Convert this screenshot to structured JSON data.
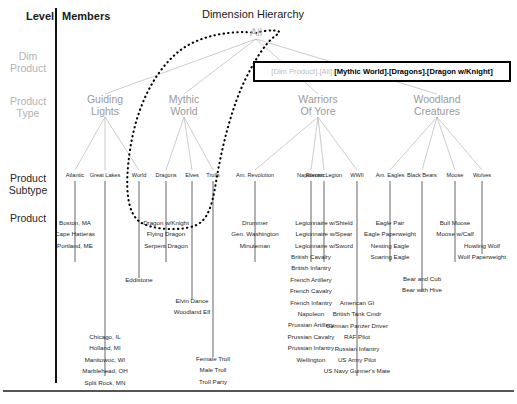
{
  "header": {
    "level_label": "Level",
    "members_label": "Members",
    "title": "Dimension Hierarchy"
  },
  "levels": [
    {
      "name": "dim-product",
      "label": "Dim\nProduct",
      "line1": "Dim",
      "line2": "Product",
      "tone": "gray",
      "y": 50
    },
    {
      "name": "product-type",
      "label": "Product\nType",
      "line1": "Product",
      "line2": "Type",
      "tone": "gray",
      "y": 95
    },
    {
      "name": "product-subtype",
      "label": "Product\nSubtype",
      "line1": "Product",
      "line2": "Subtype",
      "tone": "dark",
      "y": 172
    },
    {
      "name": "product",
      "label": "Product",
      "line1": "Product",
      "line2": "",
      "tone": "dark",
      "y": 212
    }
  ],
  "root": {
    "label": "All",
    "x": 256,
    "y": 33
  },
  "callout": {
    "prefix": "[Dim Product].[All].",
    "highlight": "[Mythic World].[Dragons].[Dragon w/Knight]"
  },
  "product_types": [
    {
      "name": "guiding-lights",
      "line1": "Guiding",
      "line2": "Lights",
      "x": 105
    },
    {
      "name": "mythic-world",
      "line1": "Mythic",
      "line2": "World",
      "x": 184
    },
    {
      "name": "warriors-of-yore",
      "line1": "Warriors",
      "line2": "Of Yore",
      "x": 318
    },
    {
      "name": "woodland-creatures",
      "line1": "Woodland",
      "line2": "Creatures",
      "x": 437
    }
  ],
  "subtypes": [
    {
      "name": "atlantic",
      "label": "Atlantic",
      "x": 75,
      "products": [
        "Boston, MA",
        "Cape Hatteras",
        "Portland, ME"
      ],
      "products_top": 217,
      "stem_bottom": 262
    },
    {
      "name": "great-lakes",
      "label": "Great Lakes",
      "x": 105,
      "products": [
        "Chicago, IL",
        "Holland, MI",
        "Manitowoc, WI",
        "Marblehead, OH",
        "Split Rock, MN"
      ],
      "products_top": 331,
      "stem_bottom": 376
    },
    {
      "name": "world",
      "label": "World",
      "x": 139,
      "products": [
        "Eddistone"
      ],
      "products_top": 274,
      "stem_bottom": 278
    },
    {
      "name": "dragons",
      "label": "Dragons",
      "x": 166,
      "products": [
        "Dragon w/Knight",
        "Flying Dragon",
        "Serpent Dragon"
      ],
      "products_top": 217,
      "stem_bottom": 262
    },
    {
      "name": "elves",
      "label": "Elves",
      "x": 192,
      "products": [
        "Elvin Dance",
        "Woodland Elf"
      ],
      "products_top": 295,
      "stem_bottom": 299
    },
    {
      "name": "trolls",
      "label": "Trolls",
      "x": 213,
      "products": [
        "Female Troll",
        "Male Troll",
        "Troll Party"
      ],
      "products_top": 353,
      "stem_bottom": 357
    },
    {
      "name": "am-revolution",
      "label": "Am. Revolution",
      "x": 255,
      "products": [
        "Drummer",
        "Gen. Washington",
        "Minuteman"
      ],
      "products_top": 217,
      "stem_bottom": 262
    },
    {
      "name": "napoleonic",
      "label": "Napoleonic",
      "x": 311,
      "products": [
        "British Cavalry",
        "British Infantry",
        "French Artillery",
        "French Cavalry",
        "French Infantry",
        "Napoleon",
        "Prussian Artillery",
        "Prussian Cavalry",
        "Prussian Infantry",
        "Wellington"
      ],
      "products_top": 251,
      "stem_bottom": 262
    },
    {
      "name": "roman-legion",
      "label": "Roman Legion",
      "x": 324,
      "products": [
        "Legionnaire w/Shield",
        "Legionnaire w/Spear",
        "Legionnaire w/Sword"
      ],
      "products_top": 217,
      "stem_bottom": 262
    },
    {
      "name": "wwii",
      "label": "WWII",
      "x": 357,
      "products": [
        "American GI",
        "British Tank Cmdr",
        "German Panzer Driver",
        "RAF Pilot",
        "Russian Infantry",
        "US Army Pilot",
        "US Navy Gunner's Mate"
      ],
      "products_top": 297,
      "stem_bottom": 376
    },
    {
      "name": "am-eagles",
      "label": "Am. Eagles",
      "x": 390,
      "products": [
        "Eagle Pair",
        "Eagle Paperweight",
        "Nesting Eagle",
        "Soaring Eagle"
      ],
      "products_top": 217,
      "stem_bottom": 262
    },
    {
      "name": "black-bears",
      "label": "Black Bears",
      "x": 422,
      "products": [
        "Bear and Cub",
        "Bear with Hive"
      ],
      "products_top": 273,
      "stem_bottom": 292
    },
    {
      "name": "moose",
      "label": "Moose",
      "x": 455,
      "products": [
        "Bull Moose",
        "Moose w/Calf"
      ],
      "products_top": 217,
      "stem_bottom": 262
    },
    {
      "name": "wolves",
      "label": "Wolves",
      "x": 482,
      "products": [
        "Howling Wolf",
        "Wolf Paperweight"
      ],
      "products_top": 240,
      "stem_bottom": 254
    }
  ],
  "selection": {
    "name": "dragon-w-knight-lasso",
    "selected_member": "Dragon w/Knight",
    "style": "dotted"
  },
  "colors": {
    "ink": "#1a1a1a",
    "gray_label": "#b3b3b3",
    "node_gray": "#9a9a9a",
    "line_gray": "#aaaaaa",
    "lasso": "#000000"
  }
}
